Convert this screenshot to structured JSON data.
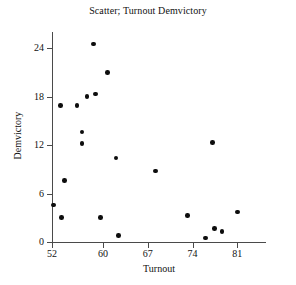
{
  "chart_data": {
    "type": "scatter",
    "title": "Scatter; Turnout Demvictory",
    "xlabel": "Turnout",
    "ylabel": "Demvictory",
    "xlim": [
      52,
      85.5
    ],
    "ylim": [
      0,
      26
    ],
    "xticks": [
      52,
      60,
      67,
      74,
      81
    ],
    "xtick_labels": [
      "52",
      "60",
      "67",
      "74",
      "81"
    ],
    "yticks": [
      0,
      6,
      12,
      18,
      24
    ],
    "ytick_labels": [
      "0",
      "6",
      "12",
      "18",
      "24"
    ],
    "grid": false,
    "legend": false,
    "marker": "filled-circle",
    "marker_color": "#0d0d0d",
    "axis_color": "#4a4a4a",
    "points": [
      {
        "x": 52.2,
        "y": 4.6
      },
      {
        "x": 53.5,
        "y": 3.0
      },
      {
        "x": 53.3,
        "y": 16.9
      },
      {
        "x": 54.0,
        "y": 7.6
      },
      {
        "x": 55.9,
        "y": 16.9
      },
      {
        "x": 56.7,
        "y": 13.6
      },
      {
        "x": 56.7,
        "y": 12.2
      },
      {
        "x": 57.5,
        "y": 18.0
      },
      {
        "x": 58.5,
        "y": 24.5
      },
      {
        "x": 58.8,
        "y": 18.3
      },
      {
        "x": 59.6,
        "y": 3.0
      },
      {
        "x": 60.7,
        "y": 21.0
      },
      {
        "x": 62.0,
        "y": 10.4
      },
      {
        "x": 62.4,
        "y": 0.8
      },
      {
        "x": 68.2,
        "y": 8.8
      },
      {
        "x": 73.2,
        "y": 3.3
      },
      {
        "x": 76.0,
        "y": 0.5
      },
      {
        "x": 77.1,
        "y": 12.3
      },
      {
        "x": 77.4,
        "y": 1.7
      },
      {
        "x": 78.6,
        "y": 1.3
      },
      {
        "x": 81.0,
        "y": 3.7
      }
    ]
  }
}
